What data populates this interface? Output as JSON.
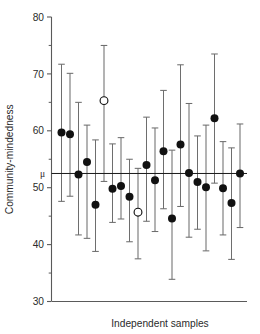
{
  "chart_data": {
    "type": "scatter",
    "title": "",
    "subtitle": "",
    "xlabel": "Independent samples",
    "ylabel": "Community-mindedness",
    "ylim": [
      30,
      80
    ],
    "xlim": [
      0,
      23
    ],
    "grid": false,
    "legend": null,
    "y_ticks_major": [
      30,
      40,
      50,
      60,
      70,
      80
    ],
    "y_ticks_minor": [
      35,
      45,
      55,
      65,
      75
    ],
    "y_tick_labels": [
      "30",
      "40",
      "50",
      "60",
      "70",
      "80"
    ],
    "x_tick_labels": [],
    "reference_line": {
      "label": "μ",
      "value": 52.5,
      "orientation": "horizontal",
      "color": "#1a1a1a"
    },
    "marker_colors": {
      "filled": "#111111",
      "open": "#111111",
      "errorbar": "#6e6e6e"
    },
    "series": [
      {
        "name": "Sample means with 95% confidence intervals",
        "point_style_key": "captures_mu",
        "x": [
          1,
          2,
          3,
          4,
          5,
          6,
          7,
          8,
          9,
          10,
          11,
          12,
          13,
          14,
          15,
          16,
          17,
          18,
          19,
          20,
          21,
          22
        ],
        "values": [
          59.7,
          59.4,
          52.3,
          54.5,
          47.0,
          65.3,
          49.8,
          50.3,
          48.4,
          45.7,
          54.0,
          51.3,
          56.4,
          44.6,
          57.6,
          52.6,
          51.0,
          50.1,
          62.2,
          49.9,
          47.3,
          52.5
        ],
        "ci_low": [
          47.6,
          48.5,
          41.7,
          41.1,
          38.8,
          51.1,
          43.9,
          44.5,
          40.5,
          37.5,
          44.1,
          42.3,
          46.3,
          33.9,
          46.7,
          41.3,
          42.7,
          38.9,
          50.8,
          41.7,
          37.4,
          43.0
        ],
        "ci_high": [
          71.7,
          70.1,
          65.0,
          61.0,
          58.4,
          75.0,
          57.7,
          58.8,
          55.0,
          53.4,
          62.4,
          60.5,
          67.1,
          56.6,
          71.6,
          64.8,
          59.1,
          61.0,
          73.5,
          58.1,
          57.0,
          61.2
        ],
        "open_marker_indices": [
          5,
          9
        ]
      }
    ],
    "annotations": []
  },
  "figure": {
    "background_color": "#ffffff",
    "axis_color": "#5a5a5a",
    "text_color": "#2b2b2b"
  }
}
